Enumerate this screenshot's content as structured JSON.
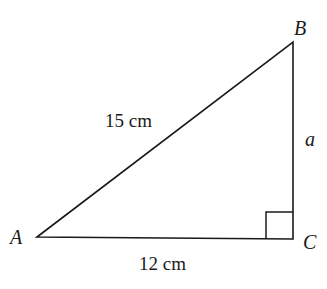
{
  "diagram": {
    "type": "right-triangle",
    "vertices": {
      "A": {
        "label": "A",
        "x": 37,
        "y": 237
      },
      "B": {
        "label": "B",
        "x": 293,
        "y": 42
      },
      "C": {
        "label": "C",
        "x": 293,
        "y": 239
      }
    },
    "sides": {
      "hypotenuse_AB": {
        "label": "15 cm"
      },
      "base_AC": {
        "label": "12 cm"
      },
      "height_BC": {
        "label": "a"
      }
    },
    "right_angle_at": "C",
    "line_color": "#1a1a1a"
  }
}
